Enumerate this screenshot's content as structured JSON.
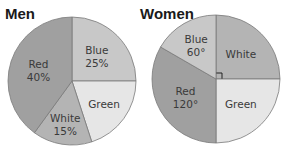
{
  "chart_data": [
    {
      "type": "pie",
      "title": "Men",
      "unit": "percent",
      "slices": [
        {
          "name": "Blue",
          "value": 25,
          "label": "25%",
          "color": "#c8c8c8"
        },
        {
          "name": "Green",
          "value": 20,
          "label": "",
          "color": "#e6e6e6"
        },
        {
          "name": "White",
          "value": 15,
          "label": "15%",
          "color": "#b4b4b4"
        },
        {
          "name": "Red",
          "value": 40,
          "label": "40%",
          "color": "#a0a0a0"
        }
      ]
    },
    {
      "type": "pie",
      "title": "Women",
      "unit": "degrees",
      "slices": [
        {
          "name": "White",
          "value": 90,
          "label": "",
          "color": "#b4b4b4",
          "right_angle_marker": true
        },
        {
          "name": "Green",
          "value": 90,
          "label": "",
          "color": "#e6e6e6"
        },
        {
          "name": "Red",
          "value": 120,
          "label": "120°",
          "color": "#a0a0a0"
        },
        {
          "name": "Blue",
          "value": 60,
          "label": "60°",
          "color": "#c8c8c8"
        }
      ]
    }
  ]
}
